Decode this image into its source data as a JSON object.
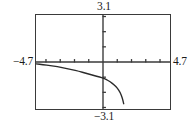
{
  "screen": {
    "name": "graphing-calculator-viewport",
    "background_color": "#ffffff",
    "frame_color": "#3a3a3a",
    "curve_color": "#2b2b2b"
  },
  "labels": {
    "y_max": "3.1",
    "y_min": "−3.1",
    "x_min": "−4.7",
    "x_max": "4.7"
  },
  "chart_data": {
    "type": "line",
    "title": "",
    "xlabel": "",
    "ylabel": "",
    "xlim": [
      -4.7,
      4.7
    ],
    "ylim": [
      -3.1,
      3.1
    ],
    "grid": false,
    "legend_position": "none",
    "axes": {
      "x_axis_y": 0,
      "y_axis_x": 0,
      "x_tick_interval": 1,
      "y_tick_interval": 1,
      "x_tick_values": [
        -4,
        -3,
        -2,
        -1,
        1,
        2,
        3,
        4
      ],
      "y_tick_values": [
        -3,
        -2,
        -1,
        1,
        2,
        3
      ],
      "tick_length_px": 3
    },
    "annotations": [
      {
        "text": "3.1",
        "position": "top-center-outside"
      },
      {
        "text": "−3.1",
        "position": "bottom-center-outside"
      },
      {
        "text": "−4.7",
        "position": "left-outside-at-x-axis"
      },
      {
        "text": "4.7",
        "position": "right-outside-at-x-axis"
      }
    ],
    "series": [
      {
        "name": "curve",
        "style": "solid",
        "color": "#2b2b2b",
        "width": 1.4,
        "x": [
          -4.7,
          -4.2,
          -3.7,
          -3.2,
          -2.7,
          -2.2,
          -1.7,
          -1.2,
          -0.7,
          -0.2,
          0.0,
          0.2,
          0.5,
          0.8,
          1.0,
          1.2,
          1.35,
          1.45
        ],
        "y": [
          -0.12,
          -0.17,
          -0.24,
          -0.31,
          -0.4,
          -0.5,
          -0.61,
          -0.74,
          -0.88,
          -1.0,
          -1.06,
          -1.14,
          -1.3,
          -1.52,
          -1.72,
          -2.0,
          -2.35,
          -2.75
        ]
      }
    ]
  }
}
